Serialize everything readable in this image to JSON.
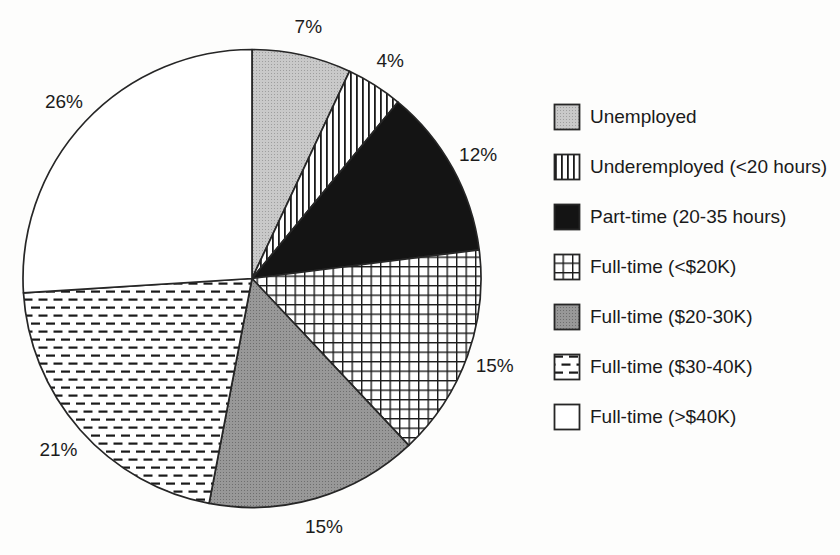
{
  "chart_data": {
    "type": "pie",
    "title": "",
    "legend_position": "right",
    "direction": "clockwise",
    "start_angle_deg": 0,
    "total": 100,
    "slices": [
      {
        "label": "Unemployed",
        "value": 7,
        "pct_label": "7%",
        "pattern": "dots-light",
        "fill": "#c6c6c6"
      },
      {
        "label": "Underemployed (<20 hours)",
        "value": 4,
        "pct_label": "4%",
        "pattern": "vertical-lines",
        "fill": "#ffffff"
      },
      {
        "label": "Part-time (20-35 hours)",
        "value": 12,
        "pct_label": "12%",
        "pattern": "solid-black",
        "fill": "#141414"
      },
      {
        "label": "Full-time (<$20K)",
        "value": 15,
        "pct_label": "15%",
        "pattern": "grid",
        "fill": "#ffffff"
      },
      {
        "label": "Full-time ($20-30K)",
        "value": 15,
        "pct_label": "15%",
        "pattern": "solid-darkgray",
        "fill": "#919191"
      },
      {
        "label": "Full-time ($30-40K)",
        "value": 21,
        "pct_label": "21%",
        "pattern": "horizontal-dashes",
        "fill": "#ffffff"
      },
      {
        "label": "Full-time (>$40K)",
        "value": 26,
        "pct_label": "26%",
        "pattern": "plain-white",
        "fill": "#ffffff"
      }
    ],
    "colors": {
      "outline": "#262626",
      "pattern_ink": "#1a1a1a",
      "text": "#1b1b1b",
      "background": "#fdfdfc"
    }
  }
}
